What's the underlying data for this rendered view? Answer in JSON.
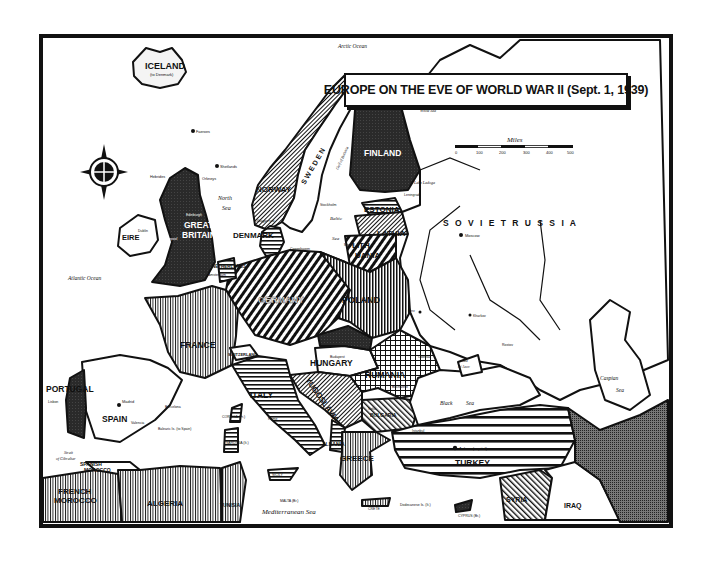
{
  "title": "EUROPE ON THE EVE OF WORLD WAR II (Sept. 1, 1939)",
  "scale": {
    "label": "Miles",
    "ticks": [
      "0",
      "100",
      "200",
      "300",
      "400",
      "500"
    ]
  },
  "colors": {
    "ink": "#111111",
    "paper": "#ffffff",
    "dark_fill": "#2a2a2a"
  },
  "compass": {
    "icon": "compass-rose-icon"
  },
  "countries": [
    {
      "name": "ICELAND",
      "sub": "(to Denmark)"
    },
    {
      "name": "NORWAY"
    },
    {
      "name": "SWEDEN"
    },
    {
      "name": "FINLAND"
    },
    {
      "name": "ESTONIA"
    },
    {
      "name": "LATVIA"
    },
    {
      "name": "LITHUANIA"
    },
    {
      "name": "DENMARK"
    },
    {
      "name": "GREAT BRITAIN"
    },
    {
      "name": "EIRE"
    },
    {
      "name": "NETHERLANDS"
    },
    {
      "name": "GERMANY"
    },
    {
      "name": "POLAND"
    },
    {
      "name": "SOVIET RUSSIA"
    },
    {
      "name": "FRANCE"
    },
    {
      "name": "SWITZERLAND"
    },
    {
      "name": "PORTUGAL"
    },
    {
      "name": "SPAIN"
    },
    {
      "name": "ITALY"
    },
    {
      "name": "HUNGARY"
    },
    {
      "name": "YUGOSLAVIA"
    },
    {
      "name": "RUMANIA"
    },
    {
      "name": "BULGARIA"
    },
    {
      "name": "ALBANIA"
    },
    {
      "name": "GREECE"
    },
    {
      "name": "TURKEY"
    },
    {
      "name": "SYRIA"
    },
    {
      "name": "IRAQ"
    },
    {
      "name": "SPANISH MOROCCO"
    },
    {
      "name": "FRENCH MOROCCO"
    },
    {
      "name": "ALGERIA"
    },
    {
      "name": "TUNISIA"
    }
  ],
  "labels": {
    "iceland": "ICELAND",
    "iceland_sub": "(to Denmark)",
    "norway": "NORWAY",
    "sweden": "S W E D E N",
    "finland": "FINLAND",
    "estonia": "ESTONIA",
    "latvia": "LATVIA",
    "lithuania_1": "LITH-",
    "lithuania_2": "UANIA",
    "denmark": "DENMARK",
    "great_britain_1": "GREAT",
    "great_britain_2": "BRITAIN",
    "eire": "EIRE",
    "netherlands": "NETHERLANDS",
    "germany": "GERMANY",
    "poland": "POLAND",
    "soviet_russia": "S O V I E T   R U S S I A",
    "france": "FRANCE",
    "switzerland": "SWITZERLAND",
    "portugal": "PORTUGAL",
    "spain": "SPAIN",
    "italy": "ITALY",
    "hungary": "HUNGARY",
    "yugoslavia": "YUGOSLAVIA",
    "rumania": "RUMANIA",
    "bulgaria": "BULGARIA",
    "albania": "ALBANIA",
    "greece": "GREECE",
    "turkey": "TURKEY",
    "syria": "SYRIA",
    "iraq": "IRAQ",
    "spanish_morocco_1": "SPANISH",
    "spanish_morocco_2": "MOROCCO",
    "french_morocco_1": "FRENCH",
    "french_morocco_2": "MOROCCO",
    "algeria": "ALGERIA",
    "tunisia": "TUNISIA",
    "corsica": "CORSICA (Fr.)",
    "sardinia": "SARDINIA (It.)",
    "sicily": "SICILY",
    "malta": "MALTA (Br.)",
    "crete": "CRETE",
    "cyprus": "CYPRUS (Br.)",
    "dodecanese": "Dodecanese Is. (It.)",
    "balearic": "Balearic Is. (to Spain)"
  },
  "seas": {
    "arctic": "Arctic Ocean",
    "atlantic": "Atlantic Ocean",
    "north_sea_1": "North",
    "north_sea_2": "Sea",
    "baltic_1": "Baltic",
    "baltic_2": "Sea",
    "black_1": "Black",
    "black_2": "Sea",
    "caspian_1": "Caspian",
    "caspian_2": "Sea",
    "mediterranean": "Mediterranean Sea",
    "azov_1": "Sea",
    "azov_2": "of Azov",
    "white": "White Sea",
    "skagerrak": "Skagerrak",
    "gibraltar_1": "Strait",
    "gibraltar_2": "of Gibraltar",
    "bothnia": "Gulf of Bothnia",
    "lake_ladoga": "Lake Ladoga"
  },
  "cities": {
    "moscow": "Moscow",
    "leningrad": "Leningrad",
    "kiev": "Kiev",
    "kharkov": "Kharkov",
    "rostov": "Rostov",
    "odessa": "Odessa",
    "stockholm": "Stockholm",
    "copenhagen": "Copenhagen",
    "memel": "Memel",
    "madrid": "Madrid",
    "lisbon": "Lisbon",
    "barcelona": "Barcelona",
    "valencia": "Valencia",
    "ankara": "Ankara (capital)",
    "istanbul": "Istanbul",
    "dublin": "Dublin",
    "liverpool": "Liverpool",
    "edinburgh": "Edinburgh",
    "amsterdam": "Amsterdam",
    "budapest": "Budapest",
    "bucharest": "Bucharest",
    "rome": "Rome",
    "sofia": "Sofia"
  },
  "islands": {
    "faeroes": "Faeroes",
    "shetlands": "Shetlands",
    "orkneys": "Orkneys",
    "hebrides": "Hebrides"
  }
}
